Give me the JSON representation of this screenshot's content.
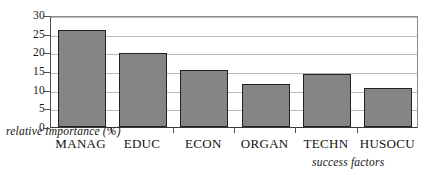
{
  "chart_data": {
    "type": "bar",
    "title": "",
    "subtitle": "",
    "categories": [
      "MANAG",
      "EDUC",
      "ECON",
      "ORGAN",
      "TECHN",
      "HUSOCU"
    ],
    "values": [
      26.0,
      19.8,
      15.3,
      11.6,
      14.3,
      10.4
    ],
    "series": [
      {
        "name": "relative importance (%)",
        "values": [
          26.0,
          19.8,
          15.3,
          11.6,
          14.3,
          10.4
        ]
      }
    ],
    "xlabel": "success factors",
    "ylabel": "relative importance (%)",
    "ylim": [
      0,
      30
    ],
    "ytick_labels": [
      "0",
      "5",
      "10",
      "15",
      "20",
      "25",
      "30"
    ],
    "ytick_values": [
      0,
      5,
      10,
      15,
      20,
      25,
      30
    ],
    "ytick_step": 5,
    "grid": "horizontal",
    "legend": "none",
    "bar_color": "#848484",
    "bar_edge_color": "#232323",
    "gridline_color": "#b9b9b9",
    "axis_color": "#3a3a3a",
    "background": "#ffffff"
  }
}
